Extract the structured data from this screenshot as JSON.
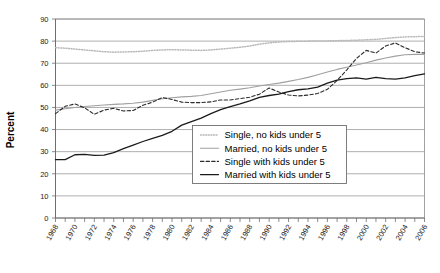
{
  "chart_data": {
    "type": "line",
    "title": "",
    "xlabel": "",
    "ylabel": "Percent",
    "ylim": [
      0,
      90
    ],
    "ytick_step": 10,
    "yticks": [
      "0",
      "10",
      "20",
      "30",
      "40",
      "50",
      "60",
      "70",
      "80",
      "90"
    ],
    "xlim": [
      1968,
      2006
    ],
    "x": [
      1968,
      1969,
      1970,
      1971,
      1972,
      1973,
      1974,
      1975,
      1976,
      1977,
      1978,
      1979,
      1980,
      1981,
      1982,
      1983,
      1984,
      1985,
      1986,
      1987,
      1988,
      1989,
      1990,
      1991,
      1992,
      1993,
      1994,
      1995,
      1996,
      1997,
      1998,
      1999,
      2000,
      2001,
      2002,
      2003,
      2004,
      2005,
      2006
    ],
    "xticks": [
      "1968",
      "1970",
      "1972",
      "1974",
      "1976",
      "1978",
      "1980",
      "1982",
      "1984",
      "1986",
      "1988",
      "1990",
      "1992",
      "1994",
      "1996",
      "1998",
      "2000",
      "2002",
      "2004",
      "2006"
    ],
    "grid": "horizontal",
    "legend_position": "center-right-lower",
    "series": [
      {
        "name": "Single, no kids under 5",
        "style": "dotted",
        "color": "#b9b9b9",
        "values": [
          77.0,
          76.8,
          76.4,
          76.0,
          75.6,
          75.2,
          75.0,
          75.1,
          75.2,
          75.4,
          75.8,
          76.0,
          76.1,
          76.0,
          75.9,
          75.8,
          76.0,
          76.4,
          76.8,
          77.2,
          77.8,
          78.6,
          79.2,
          79.6,
          79.8,
          79.9,
          80.0,
          80.0,
          80.1,
          80.2,
          80.3,
          80.4,
          80.6,
          80.8,
          81.2,
          81.6,
          81.9,
          82.0,
          82.1
        ]
      },
      {
        "name": "Married, no kids under 5",
        "style": "solid-light",
        "color": "#a0a0a0",
        "values": [
          48.8,
          49.4,
          50.0,
          50.4,
          50.8,
          51.1,
          51.4,
          51.6,
          51.9,
          52.4,
          53.2,
          53.9,
          54.4,
          54.8,
          55.0,
          55.4,
          56.2,
          57.0,
          57.8,
          58.3,
          58.9,
          59.7,
          60.4,
          61.0,
          61.8,
          62.6,
          63.6,
          64.8,
          66.0,
          67.2,
          68.2,
          69.2,
          70.2,
          71.4,
          72.4,
          73.2,
          73.8,
          74.0,
          74.0
        ]
      },
      {
        "name": "Single with kids under 5",
        "style": "dashed",
        "color": "#2b2b2b",
        "values": [
          47.2,
          50.5,
          51.6,
          49.8,
          46.9,
          48.8,
          49.6,
          48.4,
          48.6,
          51.0,
          52.4,
          54.5,
          53.6,
          52.4,
          52.2,
          52.2,
          52.5,
          53.4,
          53.4,
          54.0,
          54.6,
          56.0,
          58.8,
          57.0,
          55.6,
          55.2,
          55.6,
          56.3,
          58.2,
          62.2,
          67.0,
          72.2,
          75.8,
          74.6,
          77.8,
          79.2,
          77.0,
          75.2,
          74.6
        ]
      },
      {
        "name": "Married with kids under 5",
        "style": "solid-dark",
        "color": "#1a1a1a",
        "values": [
          26.4,
          26.4,
          28.6,
          28.8,
          28.3,
          28.4,
          29.6,
          31.4,
          33.0,
          34.6,
          36.0,
          37.4,
          39.2,
          42.0,
          43.6,
          45.2,
          47.2,
          49.0,
          50.4,
          51.6,
          53.0,
          54.6,
          55.4,
          56.0,
          57.2,
          58.0,
          58.4,
          59.2,
          61.0,
          62.4,
          63.0,
          63.4,
          62.8,
          63.6,
          63.0,
          62.8,
          63.4,
          64.4,
          65.2
        ]
      }
    ],
    "legend": [
      {
        "label": "Single, no kids under 5",
        "style": "dotted",
        "color": "#b9b9b9"
      },
      {
        "label": "Married, no kids under 5",
        "style": "solid-light",
        "color": "#a0a0a0"
      },
      {
        "label": "Single with kids under 5",
        "style": "dashed",
        "color": "#2b2b2b"
      },
      {
        "label": "Married with kids under 5",
        "style": "solid-dark",
        "color": "#1a1a1a"
      }
    ]
  }
}
